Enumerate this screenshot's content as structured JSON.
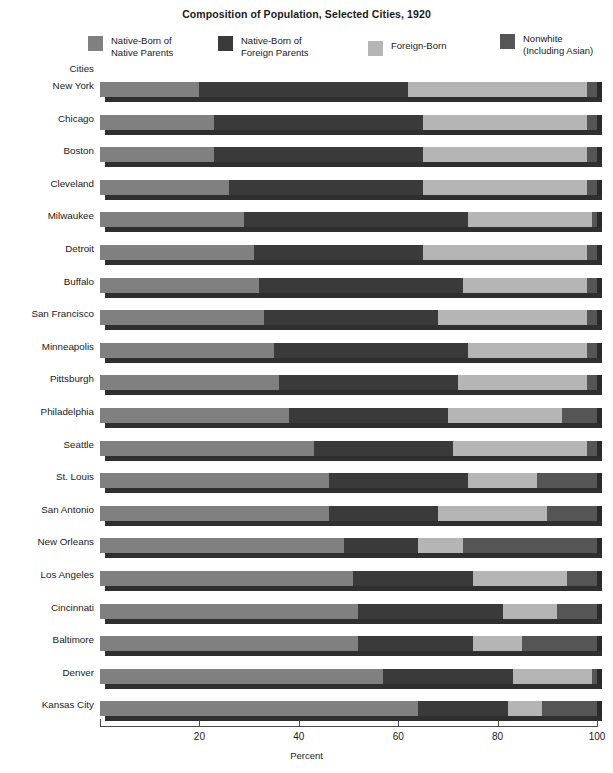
{
  "title": "Composition of Population, Selected Cities, 1920",
  "axis": {
    "category_axis_label": "Cities",
    "value_axis_label": "Percent",
    "ticks": [
      {
        "value": 20,
        "label": "20"
      },
      {
        "value": 40,
        "label": "40"
      },
      {
        "value": 60,
        "label": "60"
      },
      {
        "value": 80,
        "label": "80"
      },
      {
        "value": 100,
        "label": "100"
      }
    ]
  },
  "legend": [
    {
      "label": "Native-Born of\nNative Parents",
      "color": "#808080",
      "key": "native_born_native_parents"
    },
    {
      "label": "Native-Born of\nForeign Parents",
      "color": "#3a3a3a",
      "key": "native_born_foreign_parents"
    },
    {
      "label": "Foreign-Born",
      "color": "#b5b5b5",
      "key": "foreign_born"
    },
    {
      "label": "Nonwhite\n(Including Asian)",
      "color": "#555555",
      "key": "nonwhite"
    }
  ],
  "colors": {
    "native_born_native_parents": "#808080",
    "native_born_foreign_parents": "#3a3a3a",
    "foreign_born": "#b5b5b5",
    "nonwhite": "#555555",
    "shadow": "#2f2f2f",
    "axis": "#4a4a4a"
  },
  "chart_data": {
    "type": "bar",
    "orientation": "horizontal",
    "stacked": true,
    "percent": true,
    "title": "Composition of Population, Selected Cities, 1920",
    "xlabel": "Percent",
    "ylabel": "Cities",
    "xlim": [
      0,
      100
    ],
    "grid": false,
    "legend_position": "top",
    "categories": [
      "New York",
      "Chicago",
      "Boston",
      "Cleveland",
      "Milwaukee",
      "Detroit",
      "Buffalo",
      "San Francisco",
      "Minneapolis",
      "Pittsburgh",
      "Philadelphia",
      "Seattle",
      "St. Louis",
      "San Antonio",
      "New Orleans",
      "Los Angeles",
      "Cincinnati",
      "Baltimore",
      "Denver",
      "Kansas City"
    ],
    "series": [
      {
        "name": "Native-Born of Native Parents",
        "color": "#808080",
        "values": [
          20,
          23,
          23,
          26,
          29,
          31,
          32,
          33,
          35,
          36,
          38,
          43,
          46,
          46,
          49,
          51,
          52,
          52,
          57,
          64
        ]
      },
      {
        "name": "Native-Born of Foreign Parents",
        "color": "#3a3a3a",
        "values": [
          42,
          42,
          42,
          39,
          45,
          34,
          41,
          35,
          39,
          36,
          32,
          28,
          28,
          22,
          15,
          24,
          29,
          23,
          26,
          18
        ]
      },
      {
        "name": "Foreign-Born",
        "color": "#b5b5b5",
        "values": [
          36,
          33,
          33,
          33,
          25,
          33,
          25,
          30,
          24,
          26,
          23,
          27,
          14,
          22,
          9,
          19,
          11,
          10,
          16,
          7
        ]
      },
      {
        "name": "Nonwhite (Including Asian)",
        "color": "#555555",
        "values": [
          2,
          2,
          2,
          2,
          1,
          2,
          2,
          2,
          2,
          2,
          7,
          2,
          12,
          10,
          27,
          6,
          8,
          15,
          1,
          11
        ]
      }
    ]
  }
}
